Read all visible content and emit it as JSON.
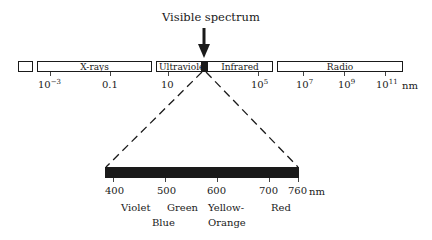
{
  "diagram": {
    "title": "Visible spectrum",
    "unit": "nm",
    "em_spectrum": {
      "bands": [
        {
          "label": "",
          "name": "gamma-rays"
        },
        {
          "label": "X-rays",
          "name": "x-rays"
        },
        {
          "label": "Ultraviolet",
          "name": "ultraviolet"
        },
        {
          "label": "",
          "name": "visible",
          "filled": true
        },
        {
          "label": "Infrared",
          "name": "infrared"
        },
        {
          "label": "Radio",
          "name": "radio"
        }
      ],
      "ticks": [
        {
          "base": "10",
          "exp": "−3"
        },
        {
          "base": "0.1",
          "exp": ""
        },
        {
          "base": "10",
          "exp": ""
        },
        {
          "base": "10",
          "exp": "5"
        },
        {
          "base": "10",
          "exp": "7"
        },
        {
          "base": "10",
          "exp": "9"
        },
        {
          "base": "10",
          "exp": "11"
        }
      ]
    },
    "visible_band": {
      "ticks": [
        "400",
        "500",
        "600",
        "700",
        "760"
      ],
      "colors": [
        {
          "label": "Violet"
        },
        {
          "label": "Blue"
        },
        {
          "label": "Green"
        },
        {
          "label": "Yellow-",
          "label2": "Orange"
        },
        {
          "label": "Red"
        }
      ]
    },
    "colors": {
      "ink": "#1a1a1a",
      "background": "#ffffff"
    }
  }
}
